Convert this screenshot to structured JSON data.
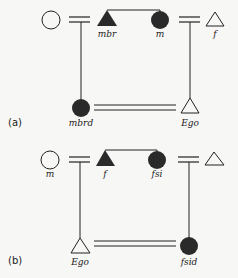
{
  "diagram": {
    "type": "kinship",
    "colors": {
      "ink": "#222222",
      "fill": "#2a2a2a",
      "background": "#f7f7f5"
    },
    "panels": [
      {
        "id": "a",
        "label": "(a)",
        "nodes": [
          {
            "id": "a1",
            "shape": "circle",
            "filled": false,
            "label": ""
          },
          {
            "id": "a2",
            "shape": "triangle",
            "filled": true,
            "label": "mbr"
          },
          {
            "id": "a3",
            "shape": "circle",
            "filled": true,
            "label": "m"
          },
          {
            "id": "a4",
            "shape": "triangle",
            "filled": false,
            "label": "f"
          },
          {
            "id": "a5",
            "shape": "circle",
            "filled": true,
            "label": "mbrd"
          },
          {
            "id": "a6",
            "shape": "triangle",
            "filled": false,
            "label": "Ego"
          }
        ],
        "edges": [
          {
            "from": "a1",
            "to": "a2",
            "type": "marriage"
          },
          {
            "from": "a2",
            "to": "a3",
            "type": "sibling"
          },
          {
            "from": "a3",
            "to": "a4",
            "type": "marriage"
          },
          {
            "from": "a1-a2",
            "to": "a5",
            "type": "descent"
          },
          {
            "from": "a3-a4",
            "to": "a6",
            "type": "descent"
          },
          {
            "from": "a5",
            "to": "a6",
            "type": "marriage"
          }
        ]
      },
      {
        "id": "b",
        "label": "(b)",
        "nodes": [
          {
            "id": "b1",
            "shape": "circle",
            "filled": false,
            "label": "m"
          },
          {
            "id": "b2",
            "shape": "triangle",
            "filled": true,
            "label": "f"
          },
          {
            "id": "b3",
            "shape": "circle",
            "filled": true,
            "label": "fsi"
          },
          {
            "id": "b4",
            "shape": "triangle",
            "filled": false,
            "label": ""
          },
          {
            "id": "b5",
            "shape": "triangle",
            "filled": false,
            "label": "Ego"
          },
          {
            "id": "b6",
            "shape": "circle",
            "filled": true,
            "label": "fsid"
          }
        ],
        "edges": [
          {
            "from": "b1",
            "to": "b2",
            "type": "marriage"
          },
          {
            "from": "b2",
            "to": "b3",
            "type": "sibling"
          },
          {
            "from": "b3",
            "to": "b4",
            "type": "marriage"
          },
          {
            "from": "b1-b2",
            "to": "b5",
            "type": "descent"
          },
          {
            "from": "b3-b4",
            "to": "b6",
            "type": "descent"
          },
          {
            "from": "b5",
            "to": "b6",
            "type": "marriage"
          }
        ]
      }
    ]
  }
}
